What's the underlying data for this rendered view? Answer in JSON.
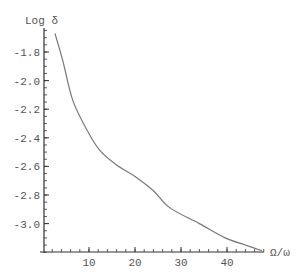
{
  "chart_data": {
    "type": "line",
    "title": "",
    "xlabel": "Ω/ω",
    "ylabel": "Log δ",
    "xlim": [
      0,
      48
    ],
    "ylim": [
      -3.2,
      -1.65
    ],
    "grid": false,
    "legend": null,
    "x_ticks": [
      10,
      20,
      30,
      40
    ],
    "x_tick_labels": [
      "10",
      "20",
      "30",
      "40"
    ],
    "y_ticks": [
      -1.8,
      -2.0,
      -2.2,
      -2.4,
      -2.6,
      -2.8,
      -3.0
    ],
    "y_tick_labels": [
      "-1.8",
      "-2.0",
      "-2.2",
      "-2.4",
      "-2.6",
      "-2.8",
      "-3.0"
    ],
    "series": [
      {
        "name": "Log δ",
        "color": "#777777",
        "x": [
          2.6,
          4.3,
          6.5,
          9.8,
          12.4,
          16,
          20,
          24,
          27.6,
          34,
          39.6,
          44,
          47.6
        ],
        "values": [
          -1.67,
          -1.86,
          -2.14,
          -2.36,
          -2.49,
          -2.59,
          -2.67,
          -2.77,
          -2.89,
          -3.0,
          -3.1,
          -3.15,
          -3.19
        ]
      }
    ]
  },
  "axes": {
    "x_label": "Ω/ω",
    "y_label": "Log δ"
  }
}
